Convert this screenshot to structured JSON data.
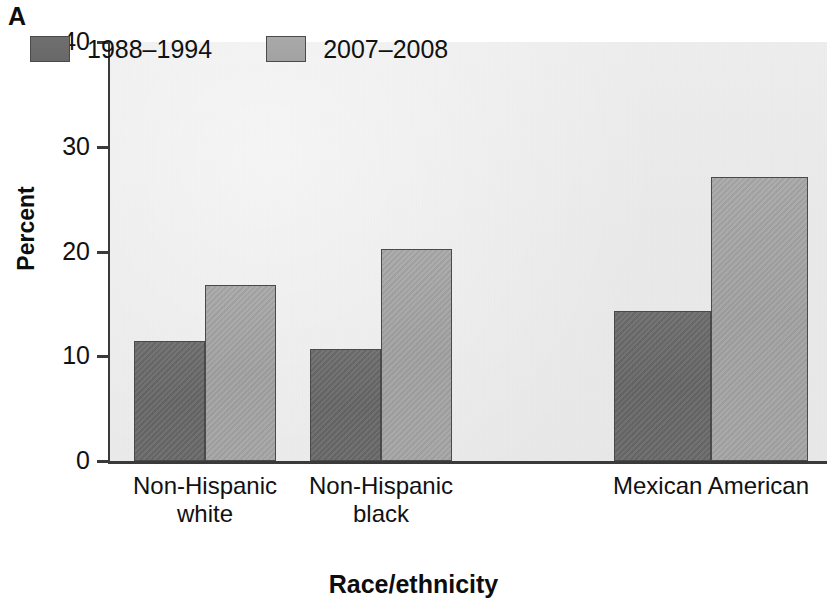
{
  "figure": {
    "panel_letter": "A"
  },
  "chart_data": {
    "type": "bar",
    "title": "",
    "xlabel": "Race/ethnicity",
    "ylabel": "Percent",
    "categories": [
      "Non-Hispanic white",
      "Non-Hispanic black",
      "Mexican American"
    ],
    "category_lines": [
      [
        "Non-Hispanic",
        "white"
      ],
      [
        "Non-Hispanic",
        "black"
      ],
      [
        "Mexican American",
        ""
      ]
    ],
    "series": [
      {
        "name": "1988–1994",
        "values": [
          11.5,
          10.7,
          14.3
        ],
        "color": "#6b6b6b"
      },
      {
        "name": "2007–2008",
        "values": [
          16.8,
          20.2,
          27.1
        ],
        "color": "#a6a6a6"
      }
    ],
    "ylim": [
      0,
      40
    ],
    "yticks": [
      0,
      10,
      20,
      30,
      40
    ],
    "ytick_labels": [
      "0",
      "10",
      "20",
      "30",
      "40"
    ],
    "grid": false,
    "legend_position": "upper left",
    "plot_background": "#eaeaea",
    "axis_color": "#3a3a3a"
  }
}
